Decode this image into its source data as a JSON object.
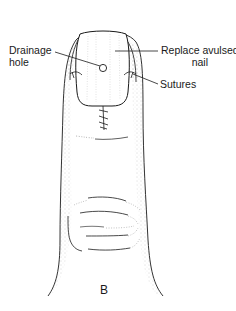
{
  "figure": {
    "panel_label": "B",
    "labels": {
      "drainage_hole_line1": "Drainage",
      "drainage_hole_line2": "hole",
      "replace_nail_line1": "Replace avulsed",
      "replace_nail_line2": "nail",
      "sutures": "Sutures"
    },
    "colors": {
      "line": "#1a1a1a",
      "stipple": "#9a9a9a",
      "background": "#ffffff"
    }
  }
}
